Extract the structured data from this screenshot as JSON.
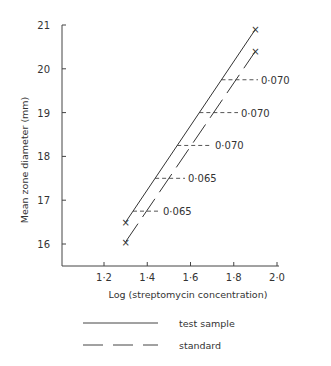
{
  "chart_data": {
    "type": "line",
    "title": "",
    "xlabel": "Log  (streptomycin  concentration)",
    "ylabel": "Mean  zone  diameter  (mm)",
    "xlim": [
      1.0,
      2.0
    ],
    "ylim": [
      15.5,
      21
    ],
    "x_ticks": [
      "1·2",
      "1·4",
      "1·6",
      "1·8",
      "2·0"
    ],
    "y_ticks": [
      "16",
      "17",
      "18",
      "19",
      "20",
      "21"
    ],
    "grid": false,
    "legend_position": "bottom",
    "series": [
      {
        "name": "test sample",
        "style": "solid",
        "x": [
          1.3,
          1.9
        ],
        "y": [
          16.5,
          20.9
        ]
      },
      {
        "name": "standard",
        "style": "dashed",
        "x": [
          1.3,
          1.9
        ],
        "y": [
          16.05,
          20.4
        ]
      }
    ],
    "annotations": [
      {
        "y": 16.75,
        "text": "0·065"
      },
      {
        "y": 17.5,
        "text": "0·065"
      },
      {
        "y": 18.25,
        "text": "0·070"
      },
      {
        "y": 19.0,
        "text": "0·070"
      },
      {
        "y": 19.75,
        "text": "0·070"
      }
    ]
  },
  "legend": {
    "items": [
      {
        "label": "test sample",
        "style": "solid"
      },
      {
        "label": "standard",
        "style": "dashed"
      }
    ]
  }
}
